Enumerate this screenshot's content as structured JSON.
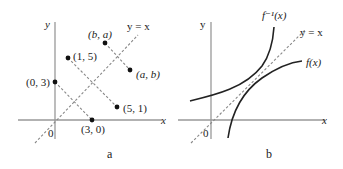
{
  "panels": [
    {
      "id": "a",
      "caption": "a",
      "axis_labels": {
        "x": "x",
        "y": "y",
        "origin": "0"
      },
      "line_label": "y = x",
      "points": [
        {
          "label": "(0, 3)",
          "x": 0,
          "y": 3
        },
        {
          "label": "(3, 0)",
          "x": 3,
          "y": 0
        },
        {
          "label": "(1, 5)",
          "x": 1,
          "y": 5
        },
        {
          "label": "(5, 1)",
          "x": 5,
          "y": 1
        },
        {
          "label": "(b, a)",
          "x": "b",
          "y": "a"
        },
        {
          "label": "(a, b)",
          "x": "a",
          "y": "b"
        }
      ],
      "reflection_segments": [
        [
          "(0, 3)",
          "(3, 0)"
        ],
        [
          "(1, 5)",
          "(5, 1)"
        ],
        [
          "(b, a)",
          "(a, b)"
        ]
      ]
    },
    {
      "id": "b",
      "caption": "b",
      "axis_labels": {
        "x": "x",
        "y": "y",
        "origin": "0"
      },
      "line_label": "y = x",
      "curves": [
        {
          "label": "f⁻¹(x)",
          "name": "inverse-function"
        },
        {
          "label": "f(x)",
          "name": "function"
        }
      ]
    }
  ],
  "colors": {
    "axis": "#999999",
    "dashed": "#888888",
    "curve": "#222222",
    "point": "#111111"
  }
}
